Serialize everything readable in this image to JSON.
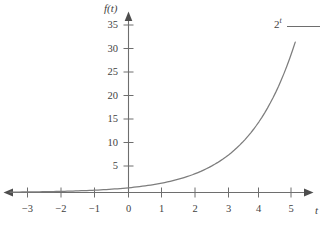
{
  "figure": {
    "background_color": "#ffffff",
    "axis_color": "#6e6e6e",
    "curve_color": "#7d7d7d",
    "text_color": "#3f3f3f"
  },
  "axes": {
    "y_axis_name": "f(t)",
    "x_axis_name": "t",
    "y_ticks": [
      "5",
      "10",
      "15",
      "20",
      "25",
      "30",
      "35"
    ],
    "x_ticks": [
      "−3",
      "−2",
      "−1",
      "0",
      "1",
      "2",
      "3",
      "4",
      "5"
    ]
  },
  "legend": {
    "base": "2",
    "exponent": "t"
  },
  "caption": {
    "sliver_text": ""
  },
  "chart_data": {
    "type": "line",
    "title": "",
    "subtitle": "",
    "xlabel": "t",
    "ylabel": "f(t)",
    "xlim": [
      -3.7,
      5.5
    ],
    "ylim": [
      0,
      36
    ],
    "grid": false,
    "legend_position": "top-right",
    "annotations": [
      "2^t"
    ],
    "xticks": [
      -3,
      -2,
      -1,
      0,
      1,
      2,
      3,
      4,
      5
    ],
    "yticks": [
      5,
      10,
      15,
      20,
      25,
      30,
      35
    ],
    "series": [
      {
        "name": "2^t",
        "color": "#7d7d7d",
        "x": [
          -3.55,
          -3.0,
          -2.5,
          -2.0,
          -1.5,
          -1.0,
          -0.5,
          0.0,
          0.5,
          1.0,
          1.5,
          2.0,
          2.5,
          3.0,
          3.5,
          4.0,
          4.5,
          5.0
        ],
        "y": [
          0.085,
          0.125,
          0.177,
          0.25,
          0.354,
          0.5,
          0.707,
          1.0,
          1.414,
          2.0,
          2.828,
          4.0,
          5.657,
          8.0,
          11.314,
          16.0,
          22.627,
          32.0
        ]
      }
    ]
  }
}
